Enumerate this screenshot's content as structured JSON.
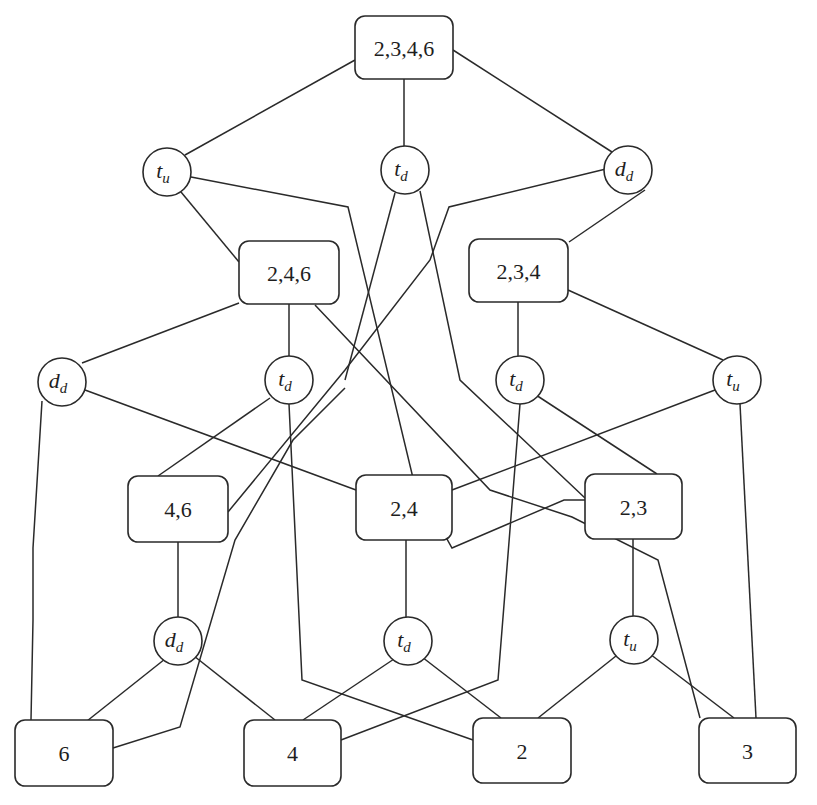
{
  "diagram": {
    "type": "lattice-graph",
    "set_nodes": [
      {
        "id": "s2346",
        "label": "2,3,4,6",
        "x": 355,
        "y": 16,
        "w": 98,
        "h": 63
      },
      {
        "id": "s246",
        "label": "2,4,6",
        "x": 239,
        "y": 241,
        "w": 100,
        "h": 63
      },
      {
        "id": "s234",
        "label": "2,3,4",
        "x": 469,
        "y": 239,
        "w": 99,
        "h": 63
      },
      {
        "id": "s46",
        "label": "4,6",
        "x": 128,
        "y": 476,
        "w": 100,
        "h": 66
      },
      {
        "id": "s24",
        "label": "2,4",
        "x": 356,
        "y": 475,
        "w": 96,
        "h": 65
      },
      {
        "id": "s23",
        "label": "2,3",
        "x": 585,
        "y": 474,
        "w": 97,
        "h": 65
      },
      {
        "id": "s6",
        "label": "6",
        "x": 15,
        "y": 720,
        "w": 98,
        "h": 66
      },
      {
        "id": "s4",
        "label": "4",
        "x": 244,
        "y": 720,
        "w": 97,
        "h": 66
      },
      {
        "id": "s2",
        "label": "2",
        "x": 473,
        "y": 718,
        "w": 98,
        "h": 65
      },
      {
        "id": "s3",
        "label": "3",
        "x": 699,
        "y": 718,
        "w": 97,
        "h": 65
      }
    ],
    "op_nodes": [
      {
        "id": "o1",
        "base": "t",
        "sub": "u",
        "cx": 167,
        "cy": 172,
        "r": 24
      },
      {
        "id": "o2",
        "base": "t",
        "sub": "d",
        "cx": 405,
        "cy": 170,
        "r": 24
      },
      {
        "id": "o3",
        "base": "d",
        "sub": "d",
        "cx": 628,
        "cy": 170,
        "r": 24
      },
      {
        "id": "o4",
        "base": "d",
        "sub": "d",
        "cx": 62,
        "cy": 382,
        "r": 24
      },
      {
        "id": "o5",
        "base": "t",
        "sub": "d",
        "cx": 289,
        "cy": 380,
        "r": 24
      },
      {
        "id": "o6",
        "base": "t",
        "sub": "d",
        "cx": 520,
        "cy": 380,
        "r": 24
      },
      {
        "id": "o7",
        "base": "t",
        "sub": "u",
        "cx": 737,
        "cy": 380,
        "r": 24
      },
      {
        "id": "o8",
        "base": "d",
        "sub": "d",
        "cx": 178,
        "cy": 641,
        "r": 24
      },
      {
        "id": "o9",
        "base": "t",
        "sub": "d",
        "cx": 408,
        "cy": 641,
        "r": 24
      },
      {
        "id": "o10",
        "base": "t",
        "sub": "u",
        "cx": 634,
        "cy": 640,
        "r": 24
      }
    ],
    "edges": [
      {
        "points": "355,60 185,155"
      },
      {
        "points": "404,79 404,146"
      },
      {
        "points": "453,50 612,152"
      },
      {
        "points": "181,192 239,262"
      },
      {
        "points": "191,177 348,207 413,478 452,548 564,500 585,500"
      },
      {
        "points": "315,305 490,490 572,517 658,560 700,718"
      },
      {
        "points": "645,190 569,242"
      },
      {
        "points": "610,168 449,207 430,260 345,370 228,512"
      },
      {
        "points": "395,193 345,380"
      },
      {
        "points": "420,191 460,380 585,498"
      },
      {
        "points": "239,303 82,363"
      },
      {
        "points": "289,304 289,356"
      },
      {
        "points": "518,302 518,356"
      },
      {
        "points": "568,290 723,360"
      },
      {
        "points": "42,401 33,548 33,620 31,720"
      },
      {
        "points": "85,390 356,490"
      },
      {
        "points": "270,398 158,476"
      },
      {
        "points": "289,404 302,680 473,740"
      },
      {
        "points": "345,388 293,440 235,540 180,727 113,748"
      },
      {
        "points": "520,404 498,680 341,740"
      },
      {
        "points": "536,395 657,474"
      },
      {
        "points": "715,390 452,490"
      },
      {
        "points": "740,404 756,718"
      },
      {
        "points": "178,542 178,617"
      },
      {
        "points": "406,540 406,617"
      },
      {
        "points": "633,539 633,616"
      },
      {
        "points": "165,659 87,721"
      },
      {
        "points": "194,656 275,720"
      },
      {
        "points": "394,659 303,720"
      },
      {
        "points": "422,657 501,718"
      },
      {
        "points": "616,656 538,718"
      },
      {
        "points": "650,654 734,718"
      }
    ]
  }
}
